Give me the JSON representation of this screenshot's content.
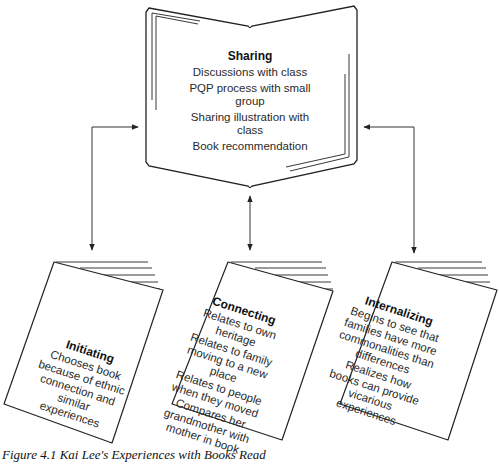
{
  "figure": {
    "caption": "Figure 4.1   Kai Lee's Experiences with Books Read"
  },
  "center_book": {
    "title": "Sharing",
    "items": [
      "Discussions with class",
      "PQP process with small group",
      "Sharing illustration with class",
      "Book recommendation"
    ]
  },
  "cards": [
    {
      "title": "Initiating",
      "items": [
        "Chooses book because of ethnic connection and similar experiences"
      ]
    },
    {
      "title": "Connecting",
      "items": [
        "Relates to own heritage",
        "Relates to family moving to a new place",
        "Relates to people when they moved",
        "Compares her grandmother with mother in book"
      ]
    },
    {
      "title": "Internalizing",
      "items": [
        "Begins to see that families have more commonalities than differences",
        "Realizes how books can provide vicarious experiences"
      ]
    }
  ],
  "colors": {
    "line": "#222222",
    "text": "#2a2a2a",
    "background": "#ffffff"
  }
}
